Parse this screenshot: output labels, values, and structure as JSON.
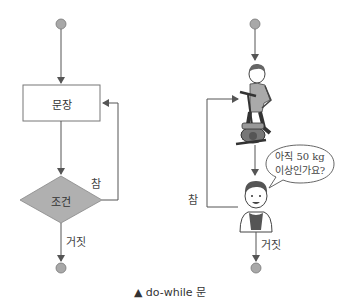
{
  "left_flowchart": {
    "process_label": "문장",
    "condition_label": "조건",
    "true_label": "참",
    "false_label": "거짓"
  },
  "right_illustration": {
    "speech_line1": "아직 50 kg",
    "speech_line2": "이상인가요?",
    "true_label": "참",
    "false_label": "거짓"
  },
  "caption": {
    "marker": "▲",
    "text": "do-while 문"
  },
  "colors": {
    "node_fill": "#a8a8a8",
    "diamond_fill": "#b0b0b0",
    "line": "#555555"
  }
}
